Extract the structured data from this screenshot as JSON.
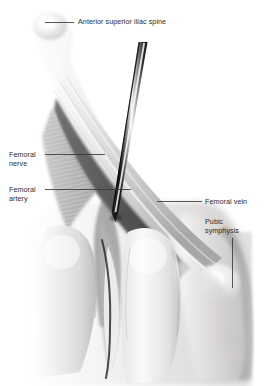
{
  "figure": {
    "width": 266,
    "height": 386,
    "background_color": "#ffffff",
    "text_color": "#2c2c2c",
    "leader_line_color": "#3a3a3a"
  },
  "labels": {
    "asis": {
      "text": "Anterior superior iliac spine",
      "leader": "horizontal-left"
    },
    "femoral_nerve": {
      "line1": "Femoral",
      "line2": "nerve",
      "leader": "horizontal-right"
    },
    "femoral_artery": {
      "line1": "Femoral",
      "line2": "artery",
      "leader": "horizontal-right"
    },
    "femoral_vein": {
      "text": "Femoral vein",
      "leader": "horizontal-left"
    },
    "pubic_symphysis": {
      "line1": "Pubic",
      "line2": "symphysis",
      "leader": "vertical-down"
    }
  },
  "anatomy": {
    "needle": {
      "name": "injection-needle",
      "shaft_color": "#1e1e1e",
      "highlight_color": "#f2f2f2",
      "mid_color": "#8a8a8a"
    },
    "colors": {
      "skin_light": "#f0efee",
      "skin_mid": "#d9d7d6",
      "skin_shadow": "#b4b2b1",
      "muscle_gray": "#9a9897",
      "deep_shadow": "#3d3c3c",
      "bone_white": "#fbfbfb",
      "cut_edge": "#a8a6a5"
    }
  }
}
